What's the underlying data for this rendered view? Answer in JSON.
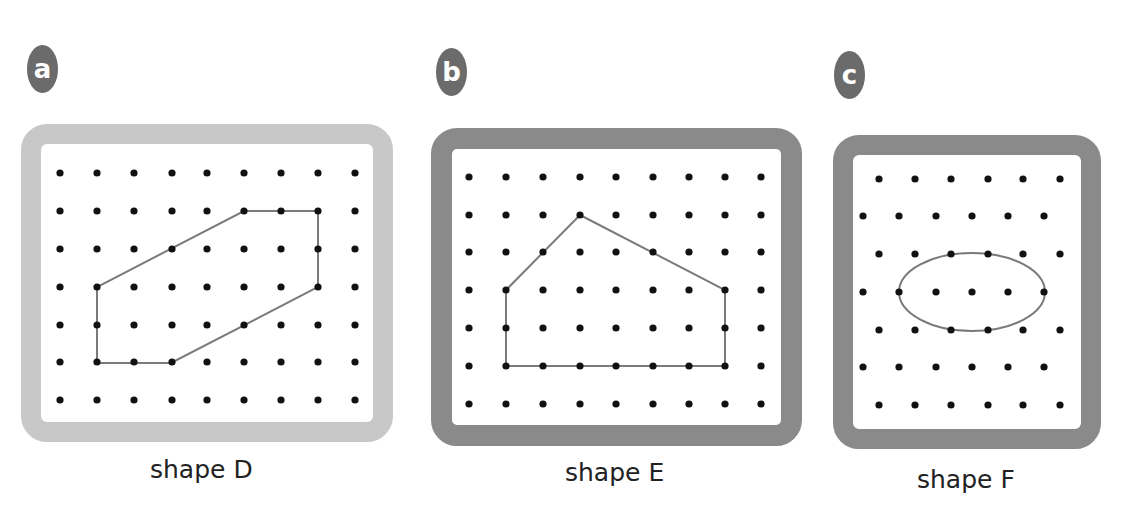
{
  "panels": [
    {
      "id": "a",
      "badge": "a",
      "caption": "shape D",
      "frame_color": "#c8c8c8",
      "grid": {
        "type": "square",
        "cols": 9,
        "rows": 7,
        "x": [
          60,
          97,
          134,
          172,
          207,
          244,
          281,
          318,
          355
        ],
        "y": [
          173,
          211,
          249,
          287,
          325,
          362,
          400
        ]
      },
      "shape": {
        "type": "polygon",
        "points": [
          [
            244,
            211
          ],
          [
            318,
            211
          ],
          [
            318,
            287
          ],
          [
            171,
            363
          ],
          [
            97,
            363
          ],
          [
            97,
            287
          ]
        ]
      }
    },
    {
      "id": "b",
      "badge": "b",
      "caption": "shape E",
      "frame_color": "#8a8a8a",
      "grid": {
        "type": "square",
        "cols": 9,
        "rows": 7,
        "x": [
          469,
          506,
          543,
          580,
          616,
          653,
          689,
          725,
          761
        ],
        "y": [
          177,
          215,
          252,
          290,
          328,
          366,
          404
        ]
      },
      "shape": {
        "type": "polygon",
        "points": [
          [
            580,
            215
          ],
          [
            725,
            290
          ],
          [
            725,
            366
          ],
          [
            506,
            366
          ],
          [
            506,
            290
          ]
        ]
      }
    },
    {
      "id": "c",
      "badge": "c",
      "caption": "shape F",
      "frame_color": "#8a8a8a",
      "grid": {
        "type": "isometric",
        "cols": 6,
        "rows": 7,
        "x_odd": [
          879,
          915,
          951,
          988,
          1023,
          1060
        ],
        "x_even": [
          863,
          899,
          936,
          972,
          1008,
          1044
        ],
        "y": [
          179,
          216,
          254,
          292,
          330,
          367,
          405
        ]
      },
      "shape": {
        "type": "ellipse",
        "cx": 972,
        "cy": 292,
        "rx": 73,
        "ry": 39
      }
    }
  ],
  "colors": {
    "dot": "#111111",
    "outline": "#7a7a7a",
    "badge": "#6b6b6b"
  }
}
